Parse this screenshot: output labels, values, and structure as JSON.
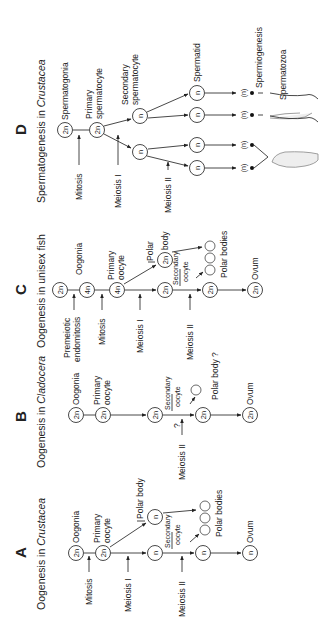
{
  "figure": {
    "orientation": "rotated 90 degrees counter-clockwise",
    "panels": [
      {
        "letter": "A",
        "title": "Oogenesis in Crustacea",
        "stages": [
          {
            "ploidy": "2n",
            "label": "Oogonia"
          },
          {
            "ploidy": "2n",
            "label": "Primary oocyte"
          },
          {
            "ploidy": "n",
            "label": "Secondary oocyte"
          },
          {
            "ploidy": "n",
            "label": "Polar body"
          },
          {
            "ploidy": "n",
            "label": ""
          },
          {
            "ploidy": "",
            "label": "Polar bodies"
          },
          {
            "ploidy": "n",
            "label": "Ovum"
          }
        ],
        "processes": [
          "Mitosis",
          "Meiosis I",
          "Meiosis II"
        ]
      },
      {
        "letter": "B",
        "title": "Oogenesis in Cladocera",
        "stages": [
          {
            "ploidy": "2n",
            "label": "Oogonia"
          },
          {
            "ploidy": "2n",
            "label": "Primary oocyte"
          },
          {
            "ploidy": "2n",
            "label": ""
          },
          {
            "ploidy": "2n",
            "label": "Secondary oocyte"
          },
          {
            "ploidy": "",
            "label": "Polar body ?"
          },
          {
            "ploidy": "2n",
            "label": "Ovum"
          }
        ],
        "processes": [
          "Meiosis II",
          "?"
        ]
      },
      {
        "letter": "C",
        "title": "Oogenesis in unisex fish",
        "stages": [
          {
            "ploidy": "2n",
            "label": ""
          },
          {
            "ploidy": "4n",
            "label": "Oogonia"
          },
          {
            "ploidy": "4n",
            "label": "Primary oocyte"
          },
          {
            "ploidy": "2n",
            "label": "Secondary oocyte"
          },
          {
            "ploidy": "2n",
            "label": "Polar body"
          },
          {
            "ploidy": "2n",
            "label": ""
          },
          {
            "ploidy": "",
            "label": "Polar bodies"
          },
          {
            "ploidy": "2n",
            "label": "Ovum"
          }
        ],
        "processes": [
          "Premeiotic endomitosis",
          "Mitosis",
          "Meiosis I",
          "Meiosis II"
        ]
      },
      {
        "letter": "D",
        "title": "Spermatogenesis in Crustacea",
        "stages": [
          {
            "ploidy": "2n",
            "label": "Spermatogonia"
          },
          {
            "ploidy": "2n",
            "label": "Primary spermatocyte"
          },
          {
            "ploidy": "n",
            "label": "Secondary spermatocyte"
          },
          {
            "ploidy": "n",
            "label": "Spermatid"
          },
          {
            "ploidy": "(n)",
            "label": "Spermiogenesis"
          },
          {
            "ploidy": "",
            "label": "Spermatozoa"
          }
        ],
        "processes": [
          "Mitosis",
          "Meiosis I",
          "Meiosis II"
        ]
      }
    ]
  },
  "labels": {
    "A": "A",
    "B": "B",
    "C": "C",
    "D": "D",
    "titleA_pre": "Oogenesis in ",
    "titleA_it": "Crustacea",
    "titleB_pre": "Oogenesis in ",
    "titleB_it": "Cladocera",
    "titleC": "Oogenesis in unisex fish",
    "titleD_pre": "Spermatogenesis in ",
    "titleD_it": "Crustacea",
    "two_n": "2n",
    "four_n": "4n",
    "n": "n",
    "n_paren": "(n)",
    "oogonia": "Oogonia",
    "primary": "Primary",
    "oocyte": "oocyte",
    "secondary": "Secondary",
    "polar_body": "Polar body",
    "polar": "Polar",
    "body": "body",
    "polar_bodies": "Polar bodies",
    "polar_body_q": "Polar body ?",
    "ovum": "Ovum",
    "mitosis": "Mitosis",
    "meiosis_1": "Meiosis I",
    "meiosis_2": "Meiosis II",
    "question": "?",
    "premeiotic": "Premeiotic",
    "endomitosis": "endomitosis",
    "spermatogonia": "Spermatogonia",
    "spermatocyte": "spermatocyte",
    "spermatid": "Spermatid",
    "spermiogenesis": "Spermiogenesis",
    "spermatozoa": "Spermatozoa"
  }
}
